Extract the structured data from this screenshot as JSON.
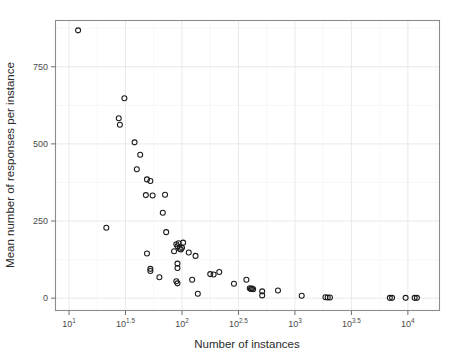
{
  "chart_data": {
    "type": "scatter",
    "title": "",
    "xlabel": "Number of instances",
    "ylabel": "Mean number of responses per instance",
    "x_scale": "log10",
    "y_scale": "linear",
    "xlim_log10": [
      0.88,
      4.28
    ],
    "ylim": [
      -40,
      900
    ],
    "grid": true,
    "legend": null,
    "xtick_labels": [
      "10^1",
      "10^1.5",
      "10^2",
      "10^2.5",
      "10^3",
      "10^3.5",
      "10^4"
    ],
    "xtick_bases": [
      "10",
      "10",
      "10",
      "10",
      "10",
      "10",
      "10"
    ],
    "xtick_exponents": [
      "1",
      "1.5",
      "2",
      "2.5",
      "3",
      "3.5",
      "4"
    ],
    "xtick_values_log10": [
      1,
      1.5,
      2,
      2.5,
      3,
      3.5,
      4
    ],
    "ytick_labels": [
      "0",
      "250",
      "500",
      "750"
    ],
    "ytick_values": [
      0,
      250,
      500,
      750
    ],
    "marker": "open-circle",
    "marker_color": "#1a1a1a",
    "points": [
      {
        "x_log10": 1.08,
        "y": 868
      },
      {
        "x_log10": 1.33,
        "y": 228
      },
      {
        "x_log10": 1.49,
        "y": 648
      },
      {
        "x_log10": 1.44,
        "y": 583
      },
      {
        "x_log10": 1.45,
        "y": 562
      },
      {
        "x_log10": 1.58,
        "y": 505
      },
      {
        "x_log10": 1.63,
        "y": 465
      },
      {
        "x_log10": 1.6,
        "y": 418
      },
      {
        "x_log10": 1.69,
        "y": 385
      },
      {
        "x_log10": 1.72,
        "y": 380
      },
      {
        "x_log10": 1.68,
        "y": 334
      },
      {
        "x_log10": 1.74,
        "y": 333
      },
      {
        "x_log10": 1.85,
        "y": 335
      },
      {
        "x_log10": 1.83,
        "y": 277
      },
      {
        "x_log10": 1.86,
        "y": 214
      },
      {
        "x_log10": 1.69,
        "y": 145
      },
      {
        "x_log10": 1.72,
        "y": 95
      },
      {
        "x_log10": 1.72,
        "y": 88
      },
      {
        "x_log10": 1.8,
        "y": 68
      },
      {
        "x_log10": 1.95,
        "y": 175
      },
      {
        "x_log10": 1.97,
        "y": 178
      },
      {
        "x_log10": 1.96,
        "y": 168
      },
      {
        "x_log10": 1.98,
        "y": 160
      },
      {
        "x_log10": 1.99,
        "y": 158
      },
      {
        "x_log10": 2.0,
        "y": 163
      },
      {
        "x_log10": 1.93,
        "y": 152
      },
      {
        "x_log10": 2.01,
        "y": 180
      },
      {
        "x_log10": 2.06,
        "y": 148
      },
      {
        "x_log10": 1.96,
        "y": 112
      },
      {
        "x_log10": 1.96,
        "y": 98
      },
      {
        "x_log10": 1.95,
        "y": 55
      },
      {
        "x_log10": 1.96,
        "y": 48
      },
      {
        "x_log10": 2.12,
        "y": 137
      },
      {
        "x_log10": 2.09,
        "y": 60
      },
      {
        "x_log10": 2.14,
        "y": 14
      },
      {
        "x_log10": 2.25,
        "y": 78
      },
      {
        "x_log10": 2.28,
        "y": 77
      },
      {
        "x_log10": 2.33,
        "y": 85
      },
      {
        "x_log10": 2.46,
        "y": 47
      },
      {
        "x_log10": 2.57,
        "y": 60
      },
      {
        "x_log10": 2.6,
        "y": 32
      },
      {
        "x_log10": 2.61,
        "y": 30
      },
      {
        "x_log10": 2.62,
        "y": 31
      },
      {
        "x_log10": 2.63,
        "y": 29
      },
      {
        "x_log10": 2.71,
        "y": 22
      },
      {
        "x_log10": 2.71,
        "y": 9
      },
      {
        "x_log10": 2.85,
        "y": 25
      },
      {
        "x_log10": 3.06,
        "y": 8
      },
      {
        "x_log10": 3.27,
        "y": 3
      },
      {
        "x_log10": 3.29,
        "y": 2
      },
      {
        "x_log10": 3.31,
        "y": 2
      },
      {
        "x_log10": 3.84,
        "y": 1
      },
      {
        "x_log10": 3.86,
        "y": 1
      },
      {
        "x_log10": 3.98,
        "y": 1
      },
      {
        "x_log10": 4.06,
        "y": 1
      },
      {
        "x_log10": 4.08,
        "y": 1
      }
    ]
  },
  "axes": {
    "x_title": "Number of instances",
    "y_title": "Mean number of responses per instance"
  }
}
